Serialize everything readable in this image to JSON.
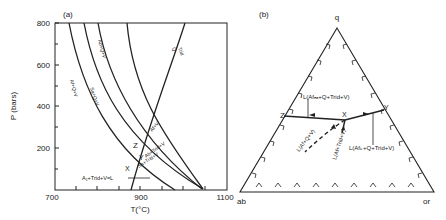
{
  "panel_a": {
    "label": "(a)",
    "ylabel": "P (bars)",
    "xlabel": "T(°C)",
    "y_ticks": [
      "800",
      "600",
      "400",
      "200"
    ],
    "x_ticks": [
      "700",
      "900",
      "1100"
    ],
    "curve_labels": {
      "af_q_v": "Af+Q+V",
      "ab_q_v": "Ab+Q+V",
      "sa_q_v": "Sa+Q+V",
      "q_trid": "Q",
      "q_trid2": "Trid",
      "af_v": "Af+V",
      "ab_trid_v": "Ab+Trid+V",
      "sa_trid_v": "Sa+Trid+V",
      "L": "L"
    },
    "points": {
      "z": "Z",
      "y": "Y",
      "x": "X"
    },
    "annotation": "A₁+Trid+V=L"
  },
  "panel_b": {
    "label": "(b)",
    "apex_q": "q",
    "corner_ab": "ab",
    "corner_or": "or",
    "points": {
      "z": "Z",
      "y": "Y",
      "x": "X"
    },
    "labels": {
      "l_na": "L(Afₙₐ+Q+Trid+V)",
      "l_k": "L(Afₖ+Q+Trid+V)",
      "l_af_q_v": "L(Af+Q+V)",
      "l_af_trid_v": "L(Af+Trid+V)"
    }
  }
}
